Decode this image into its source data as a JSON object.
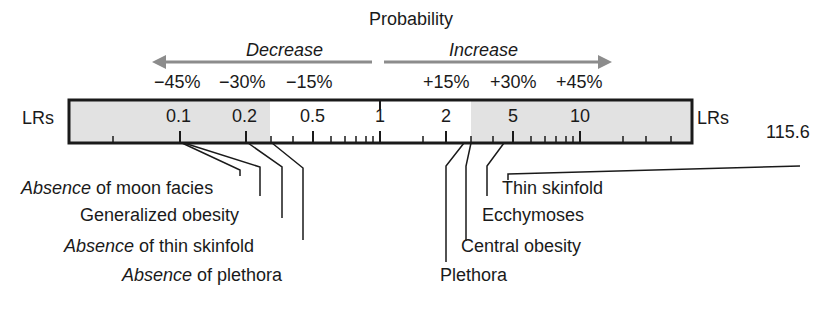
{
  "header": {
    "title": "Probability",
    "decrease_label": "Decrease",
    "increase_label": "Increase",
    "arrow_color": "#8c8c8c"
  },
  "percent_labels": {
    "decrease": [
      "−45%",
      "−30%",
      "−15%"
    ],
    "increase": [
      "+15%",
      "+30%",
      "+45%"
    ]
  },
  "scale": {
    "axis_label_left": "LRs",
    "axis_label_right": "LRs",
    "tick_labels": [
      "0.1",
      "0.2",
      "0.5",
      "1",
      "2",
      "5",
      "10"
    ],
    "shade_color": "#e2e2e2",
    "border_color": "#1a1a1a",
    "offscale_value": "115.6"
  },
  "findings_below_1": [
    {
      "emph": "Absence",
      "rest": " of moon facies"
    },
    {
      "emph": "",
      "rest": "Generalized obesity"
    },
    {
      "emph": "Absence",
      "rest": " of thin skinfold"
    },
    {
      "emph": "Absence",
      "rest": " of plethora"
    }
  ],
  "findings_above_1": [
    {
      "label": "Thin skinfold"
    },
    {
      "label": "Ecchymoses"
    },
    {
      "label": "Central obesity"
    },
    {
      "label": "Plethora"
    }
  ]
}
